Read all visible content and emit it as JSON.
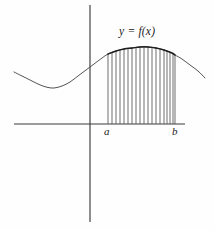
{
  "figure": {
    "title_label": "y = f(x)",
    "lower_bound_label": "a",
    "upper_bound_label": "b",
    "background_color": "#fefefe",
    "axis_color": "#3a3a3a",
    "curve_color": "#2a2a2a",
    "ordinate_color": "#555555",
    "canvas": {
      "width": 214,
      "height": 230
    }
  },
  "chart_data": {
    "type": "area",
    "title": "y = f(x)",
    "xlabel": "",
    "ylabel": "",
    "grid": false,
    "legend": "none",
    "axes": {
      "x_axis": {
        "y_px": 124,
        "x_start_px": 14,
        "x_end_px": 185
      },
      "y_axis": {
        "x_px": 90,
        "y_start_px": 5,
        "y_end_px": 222
      },
      "origin_px": {
        "x": 90,
        "y": 124
      }
    },
    "annotations": [
      {
        "text": "y = f(x)",
        "x_px": 119,
        "y_px": 26,
        "style": "italic"
      },
      {
        "text": "a",
        "x_px": 104,
        "y_px": 126,
        "style": "italic"
      },
      {
        "text": "b",
        "x_px": 172,
        "y_px": 126,
        "style": "italic"
      }
    ],
    "interval": {
      "a_px": 108,
      "b_px": 175,
      "a_label": "a",
      "b_label": "b"
    },
    "ordinate_count": 19,
    "curve_points_px": [
      [
        14,
        72
      ],
      [
        22,
        76
      ],
      [
        30,
        80
      ],
      [
        38,
        84
      ],
      [
        46,
        87
      ],
      [
        54,
        88
      ],
      [
        62,
        86
      ],
      [
        70,
        82
      ],
      [
        78,
        76
      ],
      [
        86,
        70
      ],
      [
        94,
        64
      ],
      [
        102,
        58
      ],
      [
        108,
        54
      ],
      [
        116,
        51
      ],
      [
        124,
        49
      ],
      [
        132,
        48
      ],
      [
        140,
        47
      ],
      [
        148,
        47
      ],
      [
        156,
        48
      ],
      [
        164,
        50
      ],
      [
        172,
        53
      ],
      [
        175,
        55
      ],
      [
        182,
        59
      ],
      [
        190,
        65
      ],
      [
        198,
        71
      ],
      [
        205,
        78
      ]
    ],
    "ordinates_px": [
      {
        "x": 108,
        "y_top": 54,
        "y_bottom": 124
      },
      {
        "x": 112,
        "y_top": 52,
        "y_bottom": 124
      },
      {
        "x": 116,
        "y_top": 51,
        "y_bottom": 124
      },
      {
        "x": 120,
        "y_top": 50,
        "y_bottom": 124
      },
      {
        "x": 124,
        "y_top": 49,
        "y_bottom": 124
      },
      {
        "x": 128,
        "y_top": 48,
        "y_bottom": 124
      },
      {
        "x": 132,
        "y_top": 48,
        "y_bottom": 124
      },
      {
        "x": 136,
        "y_top": 47,
        "y_bottom": 124
      },
      {
        "x": 140,
        "y_top": 47,
        "y_bottom": 124
      },
      {
        "x": 144,
        "y_top": 47,
        "y_bottom": 124
      },
      {
        "x": 148,
        "y_top": 47,
        "y_bottom": 124
      },
      {
        "x": 152,
        "y_top": 47,
        "y_bottom": 124
      },
      {
        "x": 156,
        "y_top": 48,
        "y_bottom": 124
      },
      {
        "x": 160,
        "y_top": 49,
        "y_bottom": 124
      },
      {
        "x": 164,
        "y_top": 50,
        "y_bottom": 124
      },
      {
        "x": 167,
        "y_top": 51,
        "y_bottom": 124
      },
      {
        "x": 170,
        "y_top": 52,
        "y_bottom": 124
      },
      {
        "x": 173,
        "y_top": 54,
        "y_bottom": 124
      },
      {
        "x": 175,
        "y_top": 55,
        "y_bottom": 124
      }
    ]
  }
}
